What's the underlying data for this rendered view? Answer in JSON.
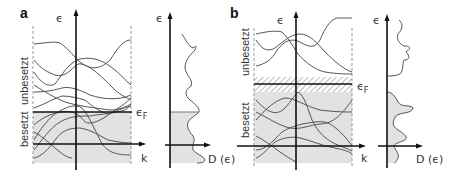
{
  "figure": {
    "type": "band-structure-and-density-of-states",
    "colors": {
      "occupied_fill": "#e2e2e2",
      "band_line": "#555555",
      "axis": "#111111",
      "hatch": "#bbbbbb"
    },
    "panels": [
      {
        "id": "a",
        "letter": "a",
        "energy_axis_label": "ϵ",
        "k_axis_label": "k",
        "fermi_label": "ϵ",
        "fermi_subscript": "F",
        "unoccupied_label": "unbesetzt",
        "occupied_label": "besetzt",
        "dos_energy_label": "ϵ",
        "dos_axis_label": "D (ϵ)",
        "description": "metal: Fermi level within band, no gap"
      },
      {
        "id": "b",
        "letter": "b",
        "energy_axis_label": "ϵ",
        "k_axis_label": "k",
        "fermi_label": "ϵ",
        "fermi_subscript": "F",
        "unoccupied_label": "unbesetzt",
        "occupied_label": "besetzt",
        "dos_energy_label": "ϵ",
        "dos_axis_label": "D (ϵ)",
        "description": "insulator/semiconductor: band gap (hatched) around Fermi level"
      }
    ]
  }
}
